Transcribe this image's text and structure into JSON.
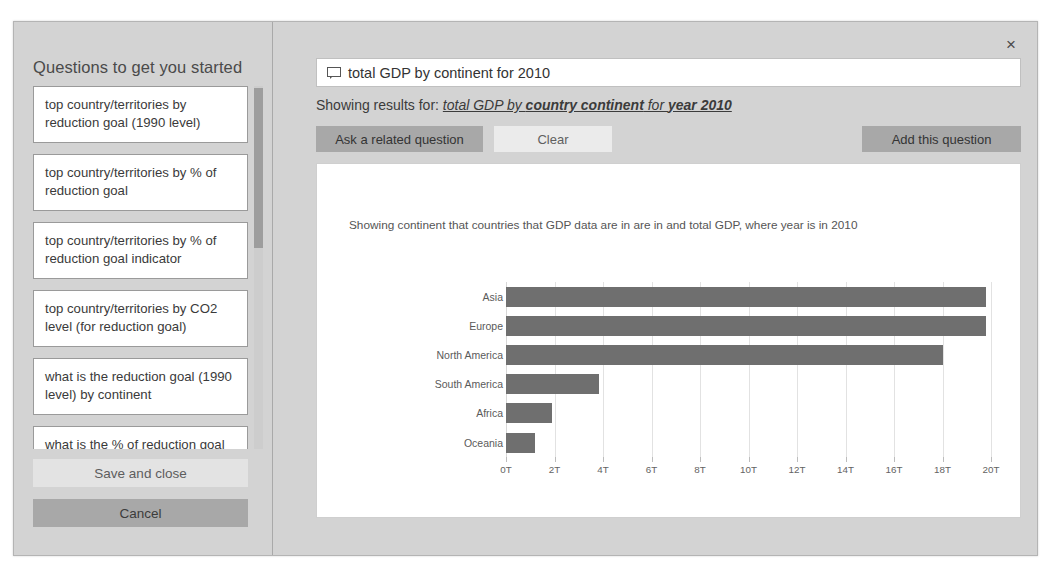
{
  "dialog": {
    "close_label": "×"
  },
  "sidebar": {
    "title": "Questions to get you started",
    "questions": [
      "top country/territories by reduction goal (1990 level)",
      "top country/territories by % of reduction goal",
      "top country/territories by % of reduction goal indicator",
      "top country/territories by CO2 level (for reduction goal)",
      "what is the reduction goal (1990 level) by continent",
      "what is the % of reduction goal"
    ],
    "save_and_close_label": "Save and close",
    "cancel_label": "Cancel"
  },
  "query": {
    "icon": "comment-bubble-icon",
    "value": "total GDP by continent for 2010",
    "placeholder": "Ask a question about your data",
    "showing_results_prefix": "Showing results for:",
    "showing_results_part1": "total GDP by ",
    "showing_results_part2": "country continent",
    "showing_results_part3": " for ",
    "showing_results_part4": "year 2010"
  },
  "actions": {
    "ask_related_label": "Ask a related question",
    "clear_label": "Clear",
    "add_question_label": "Add this question"
  },
  "chart_card": {
    "caption": "Showing continent that countries that GDP data are in are in and total GDP, where year is in 2010"
  },
  "colors": {
    "bar": "#6f6f6f",
    "dialog_bg": "#d3d3d3",
    "card_bg": "#ffffff",
    "button_primary": "#a8a8a8",
    "button_secondary": "#ebebeb"
  },
  "chart_data": {
    "type": "bar",
    "orientation": "horizontal",
    "title": "",
    "subtitle": "Showing continent that countries that GDP data are in are in and total GDP, where year is in 2010",
    "xlabel": "",
    "ylabel": "",
    "categories": [
      "Asia",
      "Europe",
      "North America",
      "South America",
      "Africa",
      "Oceania"
    ],
    "values": [
      19.8,
      19.8,
      18.0,
      3.85,
      1.9,
      1.2
    ],
    "value_unit": "T",
    "xlim": [
      0,
      20
    ],
    "xticks": [
      0,
      2,
      4,
      6,
      8,
      10,
      12,
      14,
      16,
      18,
      20
    ],
    "xtick_labels": [
      "0T",
      "2T",
      "4T",
      "6T",
      "8T",
      "10T",
      "12T",
      "14T",
      "16T",
      "18T",
      "20T"
    ],
    "grid": true,
    "legend": false,
    "series": [
      {
        "name": "total GDP",
        "values": [
          19.8,
          19.8,
          18.0,
          3.85,
          1.9,
          1.2
        ]
      }
    ]
  }
}
